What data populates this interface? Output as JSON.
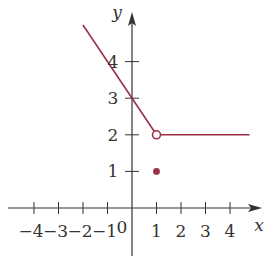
{
  "chart_data": {
    "type": "line",
    "title": "",
    "xlabel": "x",
    "ylabel": "y",
    "origin_label": "0",
    "xlim": [
      -4.8,
      5.2
    ],
    "ylim": [
      -1.4,
      5.3
    ],
    "grid": false,
    "x_ticks": [
      -4,
      -3,
      -2,
      -1,
      1,
      2,
      3,
      4
    ],
    "x_tick_labels": [
      "−4",
      "−3",
      "−2",
      "−1",
      "1",
      "2",
      "3",
      "4"
    ],
    "y_ticks": [
      1,
      2,
      3,
      4
    ],
    "y_tick_labels": [
      "1",
      "2",
      "3",
      "4"
    ],
    "series": [
      {
        "name": "left piece",
        "description": "y = 3 − x for x < 1",
        "points": [
          [
            -2,
            5
          ],
          [
            1,
            2
          ]
        ]
      },
      {
        "name": "right piece",
        "description": "y = 2 for x > 1",
        "points": [
          [
            1,
            2
          ],
          [
            4.8,
            2
          ]
        ]
      }
    ],
    "markers": [
      {
        "type": "open",
        "x": 1,
        "y": 2
      },
      {
        "type": "filled",
        "x": 1,
        "y": 1
      }
    ],
    "colors": {
      "curve": "#9b3045",
      "axis": "#333333"
    }
  }
}
